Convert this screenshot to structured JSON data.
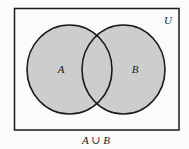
{
  "diagram": {
    "type": "venn",
    "universe_label": "U",
    "caption": "A ∪ B",
    "shaded_region": "A ∪ B",
    "sets": [
      {
        "name": "A",
        "label": "A"
      },
      {
        "name": "B",
        "label": "B"
      }
    ],
    "colors": {
      "fill": "#cdcdcd",
      "stroke": "#1a1a1a",
      "background": "#fbfbfb"
    }
  }
}
